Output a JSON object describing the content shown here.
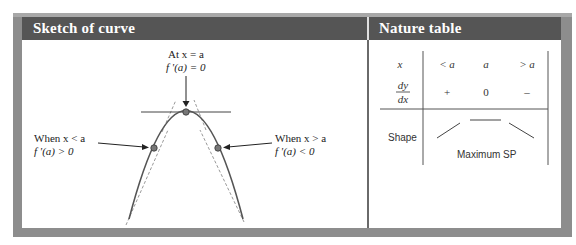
{
  "left_panel": {
    "title": "Sketch of curve",
    "annotations": {
      "top_line1": "At x = a",
      "top_line2": "f '(a) = 0",
      "left_line1": "When x < a",
      "left_line2": "f '(a) > 0",
      "right_line1": "When x > a",
      "right_line2": "f '(a) < 0"
    },
    "diagram": {
      "curve": "parabola-maximum",
      "points": [
        "left-of-a",
        "at-a",
        "right-of-a"
      ],
      "tangent_lines": "dashed",
      "curve_color": "#555555",
      "point_color": "#777777"
    }
  },
  "right_panel": {
    "title": "Nature table",
    "table": {
      "row_x": {
        "label": "x",
        "values": [
          "< a",
          "a",
          "> a"
        ]
      },
      "row_dydx": {
        "label_num": "dy",
        "label_den": "dx",
        "values": [
          "+",
          "0",
          "–"
        ]
      },
      "row_shape": {
        "label": "Shape",
        "shapes": [
          "rising",
          "flat",
          "falling"
        ],
        "caption": "Maximum SP"
      }
    }
  },
  "colors": {
    "header_bg": "#555555",
    "frame": "#8d8d8d",
    "header_text": "#ffffff"
  }
}
